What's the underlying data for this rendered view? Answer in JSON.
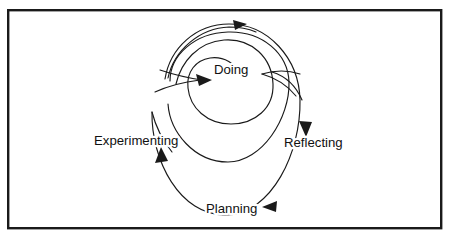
{
  "diagram": {
    "type": "cycle-spiral",
    "frame": {
      "border_color": "#1a1a1a",
      "background_color": "#ffffff"
    },
    "line_color": "#1a1a1a",
    "stages": [
      {
        "id": "doing",
        "label": "Doing",
        "position": "top",
        "order": 1
      },
      {
        "id": "reflecting",
        "label": "Reflecting",
        "position": "right",
        "order": 2
      },
      {
        "id": "planning",
        "label": "Planning",
        "position": "bottom",
        "order": 3
      },
      {
        "id": "experimenting",
        "label": "Experimenting",
        "position": "left",
        "order": 4
      }
    ],
    "arrows": [
      {
        "id": "arrow-top-outward",
        "points_to": "outward-spiral-exit",
        "direction": "right"
      },
      {
        "id": "arrow-into-doing",
        "points_to": "doing",
        "direction": "right"
      },
      {
        "id": "arrow-into-reflecting",
        "points_to": "reflecting",
        "direction": "down"
      },
      {
        "id": "arrow-into-planning",
        "points_to": "planning",
        "direction": "left"
      },
      {
        "id": "arrow-into-experimenting",
        "points_to": "experimenting",
        "direction": "up"
      }
    ],
    "loop_count": 3
  }
}
